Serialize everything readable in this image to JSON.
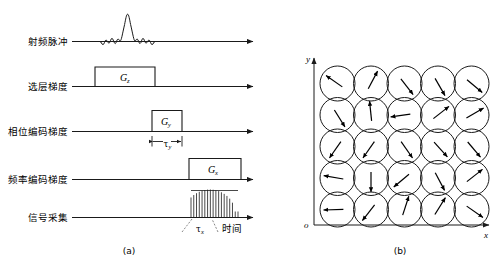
{
  "figure": {
    "panel_a": {
      "caption": "(a)",
      "time_axis_label": "时间",
      "rows": [
        {
          "id": "rf",
          "label": "射频脉冲",
          "waveform": "sinc-pulse"
        },
        {
          "id": "slice",
          "label": "选层梯度",
          "box_label": "G",
          "box_sub": "z"
        },
        {
          "id": "phase",
          "label": "相位编码梯度",
          "box_label": "G",
          "box_sub": "y",
          "duration_label": "τ",
          "duration_sub": "y"
        },
        {
          "id": "freq",
          "label": "频率编码梯度",
          "box_label": "G",
          "box_sub": "x"
        },
        {
          "id": "acq",
          "label": "信号采集",
          "duration_label": "τ",
          "duration_sub": "x",
          "echo_count": 18
        }
      ]
    },
    "panel_b": {
      "caption": "(b)",
      "x_axis_label": "x",
      "y_axis_label": "y",
      "origin_label": "o",
      "grid_rows": 5,
      "grid_cols": 5,
      "spin_angles_deg": [
        [
          145,
          62,
          -52,
          -60,
          -40
        ],
        [
          -58,
          96,
          188,
          38,
          30
        ],
        [
          -125,
          -125,
          -55,
          -48,
          -50
        ],
        [
          170,
          -90,
          -140,
          -62,
          38
        ],
        [
          182,
          -128,
          72,
          58,
          -35
        ]
      ]
    }
  },
  "colors": {
    "ink": "#1a1a1a",
    "background": "#ffffff"
  }
}
